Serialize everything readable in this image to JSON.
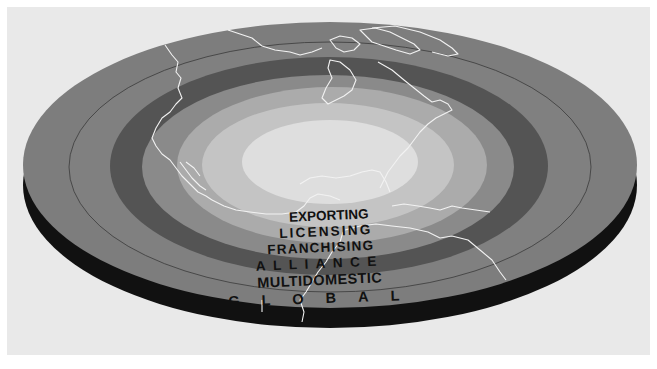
{
  "diagram": {
    "type": "concentric-disk",
    "rings": [
      {
        "id": "global",
        "label": "GLOBAL",
        "order": 6,
        "color": "#7d7d7d"
      },
      {
        "id": "multidomestic",
        "label": "MULTIDOMESTIC",
        "order": 5,
        "color": "#808080"
      },
      {
        "id": "alliance",
        "label": "ALLIANCE",
        "order": 4,
        "color": "#545454"
      },
      {
        "id": "franchising",
        "label": "FRANCHISING",
        "order": 3,
        "color": "#8a8a8a"
      },
      {
        "id": "licensing",
        "label": "LICENSING",
        "order": 2,
        "color": "#ababab"
      },
      {
        "id": "exporting",
        "label": "EXPORTING",
        "order": 1,
        "color": "#c4c4c4"
      }
    ],
    "center": {
      "color": "#dedede"
    },
    "side_color": "#111111",
    "background_color": "#e9e9e9",
    "map_outline_color": "#f4f4f4"
  },
  "labels": {
    "exporting": "EXPORTING",
    "licensing": "LICENSING",
    "franchising": "FRANCHISING",
    "alliance": "ALLIANCE",
    "multidomestic": "MULTIDOMESTIC",
    "global": "GLOBAL"
  }
}
